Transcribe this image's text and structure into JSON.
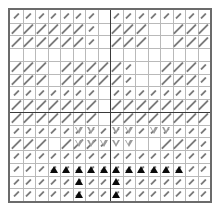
{
  "figure": {
    "title": "",
    "background_color": "#ffffff",
    "frame_color": "#6b6b6b",
    "grid_color": "#b9b9b9",
    "divider_color": "#3a3a3a"
  },
  "chart_data": {
    "type": "heatmap",
    "title": "",
    "subtitle": "",
    "xlabel": "",
    "ylabel": "",
    "xlim": [
      0,
      16
    ],
    "ylim": [
      0,
      15
    ],
    "grid": true,
    "legend_position": "none",
    "tick_labels_x": [],
    "tick_labels_y": [],
    "annotations": [],
    "grid_columns": 16,
    "grid_rows": 15,
    "dividers": {
      "vertical_x": [
        8
      ],
      "horizontal_y": [
        8
      ]
    },
    "glyph_legend": [
      {
        "name": "dash-long",
        "symbol": "long diagonal stroke",
        "color": "#7b7b7b",
        "angle_deg": -45
      },
      {
        "name": "dash-short",
        "symbol": "short diagonal stroke",
        "color": "#7b7b7b",
        "angle_deg": -45
      },
      {
        "name": "triangle-down-open",
        "symbol": "open down triangle",
        "color": "#9a9a9a"
      },
      {
        "name": "triangle-up-filled",
        "symbol": "filled up triangle",
        "color": "#0a0a0a"
      }
    ],
    "series": [
      {
        "name": "dash-field",
        "marker": "dash",
        "note": "per-cell stroke length code: 0 = empty, 1 = short, 2 = long",
        "values": [
          [
            1,
            1,
            1,
            1,
            1,
            1,
            1,
            0,
            1,
            1,
            1,
            1,
            1,
            1,
            1,
            1
          ],
          [
            2,
            2,
            2,
            2,
            2,
            2,
            1,
            0,
            2,
            2,
            2,
            0,
            0,
            2,
            2,
            2
          ],
          [
            2,
            2,
            2,
            2,
            2,
            2,
            1,
            0,
            2,
            2,
            2,
            0,
            0,
            2,
            2,
            2
          ],
          [
            0,
            0,
            0,
            0,
            0,
            0,
            0,
            0,
            0,
            0,
            0,
            0,
            0,
            0,
            0,
            0
          ],
          [
            2,
            2,
            2,
            0,
            2,
            2,
            2,
            2,
            2,
            1,
            0,
            0,
            2,
            2,
            2,
            1
          ],
          [
            2,
            2,
            2,
            0,
            2,
            2,
            2,
            2,
            2,
            1,
            0,
            0,
            2,
            2,
            2,
            1
          ],
          [
            1,
            1,
            1,
            1,
            1,
            1,
            1,
            0,
            1,
            1,
            1,
            1,
            1,
            1,
            1,
            1
          ],
          [
            2,
            2,
            2,
            2,
            2,
            2,
            2,
            0,
            2,
            2,
            2,
            2,
            2,
            2,
            2,
            2
          ],
          [
            2,
            2,
            2,
            2,
            2,
            2,
            2,
            0,
            2,
            2,
            2,
            2,
            2,
            2,
            2,
            2
          ],
          [
            1,
            1,
            1,
            1,
            1,
            1,
            1,
            1,
            1,
            1,
            1,
            1,
            1,
            1,
            1,
            1
          ],
          [
            2,
            2,
            2,
            0,
            2,
            2,
            2,
            1,
            0,
            0,
            0,
            0,
            2,
            2,
            2,
            1
          ],
          [
            1,
            1,
            1,
            1,
            1,
            1,
            1,
            1,
            1,
            1,
            1,
            1,
            1,
            1,
            1,
            1
          ],
          [
            1,
            1,
            1,
            1,
            1,
            1,
            1,
            1,
            1,
            1,
            1,
            1,
            1,
            1,
            1,
            1
          ],
          [
            1,
            1,
            1,
            1,
            1,
            1,
            1,
            1,
            1,
            1,
            1,
            1,
            1,
            1,
            1,
            1
          ],
          [
            1,
            1,
            1,
            1,
            1,
            1,
            1,
            1,
            1,
            1,
            1,
            1,
            1,
            1,
            1,
            1
          ]
        ]
      },
      {
        "name": "triangle-down-open",
        "marker": "triangle-down-open",
        "color": "#9a9a9a",
        "points": [
          {
            "x": 5,
            "y": 9
          },
          {
            "x": 6,
            "y": 9
          },
          {
            "x": 8,
            "y": 9
          },
          {
            "x": 9,
            "y": 9
          },
          {
            "x": 11,
            "y": 9
          },
          {
            "x": 12,
            "y": 9
          },
          {
            "x": 5,
            "y": 10
          },
          {
            "x": 6,
            "y": 10
          },
          {
            "x": 7,
            "y": 10
          },
          {
            "x": 8,
            "y": 10
          },
          {
            "x": 9,
            "y": 10
          }
        ]
      },
      {
        "name": "triangle-up-filled",
        "marker": "triangle-up-filled",
        "color": "#0a0a0a",
        "points": [
          {
            "x": 3,
            "y": 12
          },
          {
            "x": 4,
            "y": 12
          },
          {
            "x": 5,
            "y": 12
          },
          {
            "x": 6,
            "y": 12
          },
          {
            "x": 7,
            "y": 12
          },
          {
            "x": 8,
            "y": 12
          },
          {
            "x": 9,
            "y": 12
          },
          {
            "x": 10,
            "y": 12
          },
          {
            "x": 11,
            "y": 12
          },
          {
            "x": 12,
            "y": 12
          },
          {
            "x": 13,
            "y": 12
          },
          {
            "x": 5,
            "y": 13
          },
          {
            "x": 8,
            "y": 13
          },
          {
            "x": 5,
            "y": 14
          },
          {
            "x": 8,
            "y": 14
          }
        ]
      }
    ]
  }
}
